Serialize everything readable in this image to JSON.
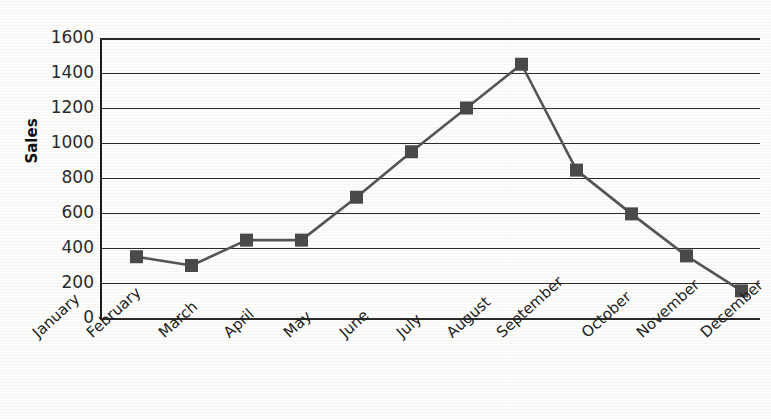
{
  "chart_data": {
    "type": "line",
    "title": "",
    "title_note": "title cropped off above top edge of image",
    "subtitle": "",
    "xlabel": "",
    "ylabel": "Sales",
    "categories": [
      "January",
      "February",
      "March",
      "April",
      "May",
      "June",
      "July",
      "August",
      "September",
      "October",
      "November",
      "December"
    ],
    "values": [
      350,
      300,
      445,
      445,
      690,
      950,
      1200,
      1450,
      845,
      595,
      355,
      155
    ],
    "series": [
      {
        "name": "Sales",
        "values": [
          350,
          300,
          445,
          445,
          690,
          950,
          1200,
          1450,
          845,
          595,
          355,
          155
        ]
      }
    ],
    "ylim": [
      0,
      1600
    ],
    "ytick_values": [
      1600,
      1400,
      1200,
      1000,
      800,
      600,
      400,
      200,
      0
    ],
    "ytick_labels": [
      "1600",
      "1400",
      "1200",
      "1000",
      "800",
      "600",
      "400",
      "200",
      "0"
    ],
    "ytick_step": 200,
    "xtick_rotation": -42,
    "grid": true,
    "grid_axis": "y",
    "legend": false,
    "legend_position": "none",
    "marker": "square",
    "colors": {
      "line": "#555555",
      "marker": "#4a4a4a",
      "grid": "#2a2a2a",
      "axis": "#1c1c1c",
      "background": "#fdfdfb",
      "text": "#1a1a1a"
    }
  }
}
